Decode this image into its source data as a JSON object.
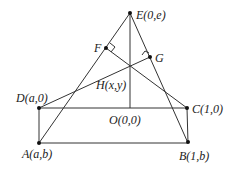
{
  "diagram": {
    "points": {
      "E": {
        "label": "E(0,e)",
        "x": 130,
        "y": 13
      },
      "F": {
        "label": "F",
        "x": 106,
        "y": 48
      },
      "G": {
        "label": "G",
        "x": 150,
        "y": 57
      },
      "H": {
        "label": "H(x,y)"
      },
      "D": {
        "label": "D(a,0)",
        "x": 39,
        "y": 108
      },
      "C": {
        "label": "C(1,0)",
        "x": 187,
        "y": 108
      },
      "O": {
        "label": "O(0,0)",
        "x": 130,
        "y": 108
      },
      "A": {
        "label": "A(a,b)",
        "x": 39,
        "y": 143
      },
      "B": {
        "label": "B(1,b)",
        "x": 188,
        "y": 142
      }
    },
    "segments": [
      "EA",
      "EB",
      "EO",
      "DC",
      "AB",
      "DA",
      "CB",
      "DG",
      "CF"
    ],
    "right_angles": [
      "F",
      "G"
    ]
  }
}
